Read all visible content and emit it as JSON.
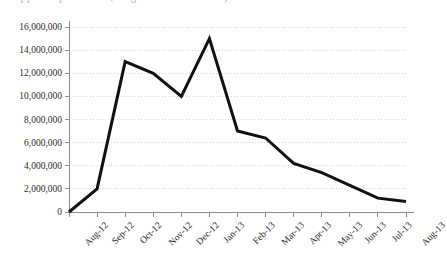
{
  "caption": {
    "clipped_line": "clipped caption line (illegible in screenshot)"
  },
  "chart_data": {
    "type": "line",
    "title": "",
    "subtitle": "",
    "xlabel": "",
    "ylabel": "",
    "categories": [
      "Aug-12",
      "Sep-12",
      "Oct-12",
      "Nov-12",
      "Dec-12",
      "Jan-13",
      "Feb-13",
      "Mar-13",
      "Apr-13",
      "May-13",
      "Jun-13",
      "Jul-13",
      "Aug-13"
    ],
    "values": [
      0,
      2000000,
      13000000,
      12000000,
      10000000,
      15000000,
      7000000,
      6400000,
      4200000,
      3400000,
      2300000,
      1200000,
      900000
    ],
    "series": [
      {
        "name": "Series 1",
        "color": "#111111",
        "values": [
          0,
          2000000,
          13000000,
          12000000,
          10000000,
          15000000,
          7000000,
          6400000,
          4200000,
          3400000,
          2300000,
          1200000,
          900000
        ]
      }
    ],
    "ylim": [
      0,
      16000000
    ],
    "ytick_values": [
      0,
      2000000,
      4000000,
      6000000,
      8000000,
      10000000,
      12000000,
      14000000,
      16000000
    ],
    "ytick_labels": [
      "0",
      "2,000,000",
      "4,000,000",
      "6,000,000",
      "8,000,000",
      "10,000,000",
      "12,000,000",
      "14,000,000",
      "16,000,000"
    ],
    "grid": true,
    "grid_style": "dotted",
    "grid_color": "#d2d2d2",
    "axis_color": "#8c8c8c",
    "legend": false,
    "legend_position": "none",
    "line_width": 3,
    "markers": false,
    "annotations": []
  }
}
